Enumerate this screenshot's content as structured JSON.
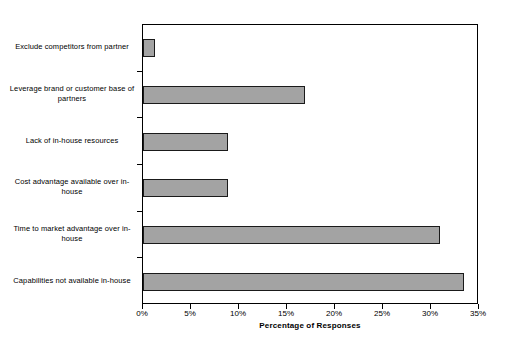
{
  "chart_data": {
    "type": "bar",
    "orientation": "horizontal",
    "title": "",
    "xlabel": "Percentage of Responses",
    "ylabel": "",
    "categories": [
      "Exclude competitors from partner",
      "Leverage brand or customer base of partners",
      "Lack of in-house resources",
      "Cost advantage available over in-house",
      "Time to market advantage over in-house",
      "Capabilities not available in-house"
    ],
    "values": [
      1.2,
      16.9,
      8.9,
      8.9,
      30.9,
      33.4
    ],
    "value_unit": "%",
    "xlim": [
      0,
      35
    ],
    "xticks": [
      0,
      5,
      10,
      15,
      20,
      25,
      30,
      35
    ],
    "xtick_labels": [
      "0%",
      "5%",
      "10%",
      "15%",
      "20%",
      "25%",
      "30%",
      "35%"
    ],
    "grid": false,
    "legend": null,
    "bar_color": "#a3a3a3",
    "bar_border_color": "#1a1a1a",
    "plot_background": "#ffffff",
    "axis_color": "#000000"
  }
}
